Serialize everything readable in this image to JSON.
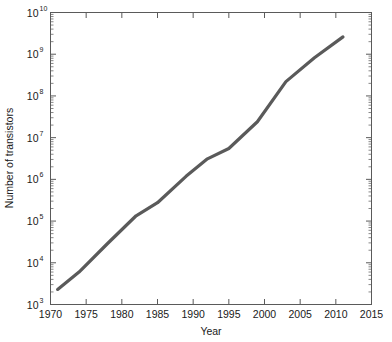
{
  "chart_data": {
    "type": "line",
    "title": "",
    "xlabel": "Year",
    "ylabel": "Number of transistors",
    "xlim": [
      1970,
      2015
    ],
    "ylim": [
      1000,
      10000000000
    ],
    "yscale": "log",
    "xscale": "linear",
    "grid": false,
    "legend": null,
    "xticks": [
      1970,
      1975,
      1980,
      1985,
      1990,
      1995,
      2000,
      2005,
      2010,
      2015
    ],
    "xtick_labels": [
      "1970",
      "1975",
      "1980",
      "1985",
      "1990",
      "1995",
      "2000",
      "2005",
      "2010",
      "2015"
    ],
    "yticks": [
      1000,
      10000,
      100000,
      1000000,
      10000000,
      100000000,
      1000000000,
      10000000000
    ],
    "ytick_labels": [
      {
        "base": "10",
        "exp": "3"
      },
      {
        "base": "10",
        "exp": "4"
      },
      {
        "base": "10",
        "exp": "5"
      },
      {
        "base": "10",
        "exp": "6"
      },
      {
        "base": "10",
        "exp": "7"
      },
      {
        "base": "10",
        "exp": "8"
      },
      {
        "base": "10",
        "exp": "9"
      },
      {
        "base": "10",
        "exp": "10"
      }
    ],
    "series": [
      {
        "name": "Transistor count",
        "color": "#5a5a5a",
        "linewidth": 3.2,
        "x": [
          1971,
          1974,
          1978,
          1982,
          1985,
          1989,
          1992,
          1995,
          1999,
          2003,
          2007,
          2011
        ],
        "y": [
          2300,
          6000,
          29000,
          134000,
          275000,
          1180000,
          3100000,
          5500000,
          24000000,
          220000000,
          820000000,
          2600000000
        ]
      }
    ]
  },
  "axis_style": {
    "box": true,
    "tick_direction": "in",
    "minor_ticks_y": true,
    "axis_color": "#5a5a5a",
    "background": "#ffffff"
  }
}
